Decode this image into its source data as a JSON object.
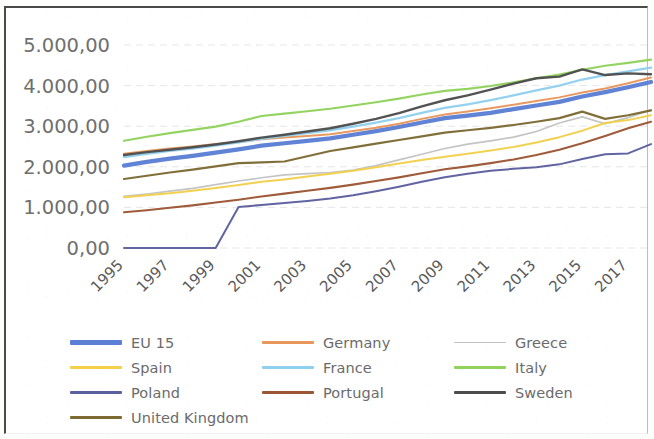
{
  "chart_data": {
    "type": "line",
    "title": "",
    "xlabel": "",
    "ylabel": "",
    "ylim": [
      0,
      5000
    ],
    "xlim": [
      1995,
      2018
    ],
    "grid": true,
    "legend_position": "bottom",
    "y_ticks": [
      "0,00",
      "1.000,00",
      "2.000,00",
      "3.000,00",
      "4.000,00",
      "5.000,00"
    ],
    "y_tick_values": [
      0,
      1000,
      2000,
      3000,
      4000,
      5000
    ],
    "x_tick_labels": [
      "1995",
      "1997",
      "1999",
      "2001",
      "2003",
      "2005",
      "2007",
      "2009",
      "2011",
      "2013",
      "2015",
      "2017"
    ],
    "x": [
      1995,
      1996,
      1997,
      1998,
      1999,
      2000,
      2001,
      2002,
      2003,
      2004,
      2005,
      2006,
      2007,
      2008,
      2009,
      2010,
      2011,
      2012,
      2013,
      2014,
      2015,
      2016,
      2017,
      2018
    ],
    "series": [
      {
        "name": "EU 15",
        "color": "#5b7fd4",
        "width": 4.2,
        "values": [
          2030,
          2120,
          2200,
          2270,
          2350,
          2430,
          2520,
          2580,
          2640,
          2700,
          2790,
          2880,
          2980,
          3090,
          3200,
          3260,
          3330,
          3420,
          3510,
          3600,
          3730,
          3840,
          3960,
          4090
        ]
      },
      {
        "name": "Germany",
        "color": "#e8965a",
        "width": 2.0,
        "values": [
          2320,
          2390,
          2450,
          2500,
          2560,
          2610,
          2680,
          2720,
          2760,
          2800,
          2880,
          2960,
          3060,
          3180,
          3290,
          3360,
          3440,
          3530,
          3620,
          3710,
          3830,
          3930,
          4060,
          4200
        ]
      },
      {
        "name": "Greece",
        "color": "#c2c2c2",
        "width": 1.7,
        "values": [
          1270,
          1330,
          1400,
          1470,
          1560,
          1650,
          1730,
          1800,
          1830,
          1860,
          1920,
          2030,
          2170,
          2310,
          2450,
          2560,
          2640,
          2730,
          2870,
          3080,
          3230,
          3060,
          3210,
          3400
        ]
      },
      {
        "name": "Spain",
        "color": "#f3cf4a",
        "width": 2.0,
        "values": [
          1250,
          1300,
          1350,
          1410,
          1480,
          1550,
          1630,
          1690,
          1760,
          1830,
          1900,
          1990,
          2080,
          2170,
          2250,
          2320,
          2400,
          2490,
          2600,
          2730,
          2890,
          3080,
          3150,
          3270
        ]
      },
      {
        "name": "France",
        "color": "#8fd0ee",
        "width": 2.3,
        "values": [
          2240,
          2320,
          2390,
          2450,
          2520,
          2600,
          2690,
          2760,
          2830,
          2900,
          2990,
          3090,
          3200,
          3330,
          3450,
          3540,
          3640,
          3760,
          3880,
          4000,
          4150,
          4260,
          4350,
          4440
        ]
      },
      {
        "name": "Italy",
        "color": "#8fd35b",
        "width": 2.1,
        "values": [
          2640,
          2740,
          2830,
          2910,
          2990,
          3110,
          3250,
          3310,
          3370,
          3430,
          3510,
          3590,
          3680,
          3780,
          3870,
          3920,
          3990,
          4080,
          4180,
          4270,
          4390,
          4490,
          4560,
          4640
        ]
      },
      {
        "name": "Poland",
        "color": "#5c5f9e",
        "width": 2.0,
        "values": [
          0,
          0,
          0,
          0,
          0,
          1010,
          1060,
          1110,
          1160,
          1220,
          1300,
          1400,
          1510,
          1630,
          1740,
          1830,
          1900,
          1950,
          1990,
          2060,
          2190,
          2310,
          2330,
          2560
        ]
      },
      {
        "name": "Portugal",
        "color": "#9c5634",
        "width": 2.1,
        "values": [
          880,
          930,
          990,
          1050,
          1120,
          1190,
          1270,
          1340,
          1410,
          1480,
          1560,
          1650,
          1740,
          1840,
          1940,
          2010,
          2090,
          2180,
          2290,
          2420,
          2580,
          2760,
          2950,
          3110
        ]
      },
      {
        "name": "Sweden",
        "color": "#4d4d4d",
        "width": 2.4,
        "values": [
          2290,
          2360,
          2420,
          2480,
          2550,
          2630,
          2720,
          2790,
          2870,
          2950,
          3060,
          3180,
          3320,
          3490,
          3640,
          3760,
          3900,
          4050,
          4180,
          4220,
          4400,
          4260,
          4300,
          4280
        ]
      },
      {
        "name": "United Kingdom",
        "color": "#7d6a33",
        "width": 2.2,
        "values": [
          1700,
          1780,
          1860,
          1930,
          2010,
          2090,
          2110,
          2130,
          2260,
          2390,
          2480,
          2570,
          2660,
          2750,
          2840,
          2900,
          2960,
          3030,
          3110,
          3200,
          3360,
          3180,
          3270,
          3390
        ]
      }
    ]
  },
  "legend": {
    "rows": [
      [
        {
          "label": "EU 15",
          "color": "#5b7fd4",
          "width": 4.2
        },
        {
          "label": "Germany",
          "color": "#e8965a",
          "width": 2.4
        },
        {
          "label": "Greece",
          "color": "#c2c2c2",
          "width": 1.8
        }
      ],
      [
        {
          "label": "Spain",
          "color": "#f3cf4a",
          "width": 2.4
        },
        {
          "label": "France",
          "color": "#8fd0ee",
          "width": 2.4
        },
        {
          "label": "Italy",
          "color": "#8fd35b",
          "width": 2.4
        }
      ],
      [
        {
          "label": "Poland",
          "color": "#5c5f9e",
          "width": 2.6
        },
        {
          "label": "Portugal",
          "color": "#9c5634",
          "width": 2.6
        },
        {
          "label": "Sweden",
          "color": "#4d4d4d",
          "width": 2.8
        }
      ],
      [
        {
          "label": "United Kingdom",
          "color": "#7d6a33",
          "width": 2.6
        }
      ]
    ]
  }
}
